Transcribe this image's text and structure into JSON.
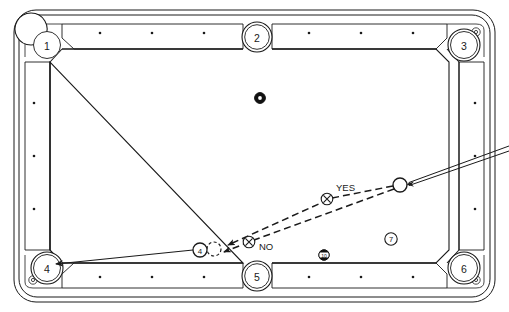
{
  "diagram": {
    "kind": "billiards-table-top-view",
    "colors": {
      "ink": "#1a1a1a",
      "cloth": "#ffffff",
      "rail": "#ffffff",
      "ball_dark": "#111111",
      "ball_light": "#ffffff"
    },
    "table": {
      "frame_label": "table-outline",
      "rails": [
        "top-rail",
        "bottom-rail",
        "left-rail",
        "right-rail"
      ],
      "diamond_count_long_rail": 7,
      "diamond_count_short_rail": 3
    },
    "pockets": [
      {
        "id": "pocket-1",
        "label": "1",
        "position": "top-left",
        "cx": 47,
        "cy": 45
      },
      {
        "id": "pocket-2",
        "label": "2",
        "position": "top-center",
        "cx": 257,
        "cy": 37
      },
      {
        "id": "pocket-3",
        "label": "3",
        "position": "top-right",
        "cx": 464,
        "cy": 45
      },
      {
        "id": "pocket-4",
        "label": "4",
        "position": "bottom-left",
        "cx": 47,
        "cy": 268
      },
      {
        "id": "pocket-5",
        "label": "5",
        "position": "bottom-center",
        "cx": 257,
        "cy": 276
      },
      {
        "id": "pocket-6",
        "label": "6",
        "position": "bottom-right",
        "cx": 464,
        "cy": 268
      }
    ],
    "balls": [
      {
        "id": "cue-ball",
        "label": "",
        "type": "cue",
        "cx": 400,
        "cy": 185,
        "r": 7
      },
      {
        "id": "object-ball",
        "label": "4",
        "type": "solid",
        "cx": 200,
        "cy": 250,
        "r": 7
      },
      {
        "id": "ball-eight",
        "label": "",
        "type": "eight",
        "cx": 260,
        "cy": 98,
        "r": 5
      },
      {
        "id": "ball-ten",
        "label": "10",
        "type": "stripe",
        "cx": 324,
        "cy": 255,
        "r": 5
      },
      {
        "id": "ball-seven",
        "label": "7",
        "type": "solid",
        "cx": 391,
        "cy": 239,
        "r": 6
      }
    ],
    "ghost_ball": {
      "id": "ghost-contact-position",
      "label": "",
      "cx": 214,
      "cy": 249,
      "r": 7,
      "style": "dashed"
    },
    "aim_markers": [
      {
        "id": "aim-marker-yes",
        "glyph": "X",
        "label": "YES",
        "cx": 327,
        "cy": 199,
        "label_x": 336,
        "label_y": 188
      },
      {
        "id": "aim-marker-no",
        "glyph": "X",
        "label": "NO",
        "cx": 249,
        "cy": 242,
        "label_x": 259,
        "label_y": 249
      }
    ],
    "paths": [
      {
        "id": "cue-ball-path-correct",
        "style": "dashed",
        "from": "cue-ball",
        "to": "ghost-ball-via-yes",
        "has_arrow": true
      },
      {
        "id": "cue-ball-path-incorrect",
        "style": "dashed",
        "from": "cue-ball",
        "to": "ghost-ball-via-no",
        "has_arrow": true
      },
      {
        "id": "object-ball-path",
        "style": "solid",
        "from": "object-ball",
        "to": "pocket-4",
        "has_arrow": true
      }
    ],
    "cue_stick": {
      "id": "cue-stick",
      "tip_x": 407,
      "tip_y": 183,
      "butt_x": 509,
      "butt_y": 148
    }
  }
}
